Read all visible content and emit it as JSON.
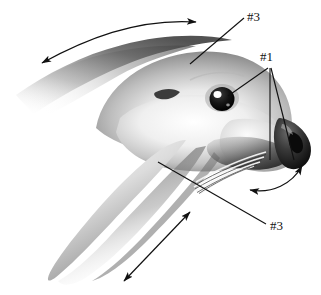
{
  "figure": {
    "background_color": "#ffffff",
    "ink_color": "#111111",
    "width": 321,
    "height": 295
  },
  "labels": [
    {
      "id": "top-3",
      "text": "#3",
      "x": 247,
      "y": 10,
      "points_to": "forehead-crown",
      "leader": "straight-line-down-left"
    },
    {
      "id": "measure-1",
      "text": "#1",
      "x": 260,
      "y": 50,
      "points_to": "eye-and-muzzle",
      "leader": "three-line-fan"
    },
    {
      "id": "bottom-3",
      "text": "#3",
      "x": 270,
      "y": 219,
      "points_to": "cheek-whisker-pad",
      "leader": "straight-line-up-left"
    }
  ],
  "arrows": [
    {
      "id": "crown-arc",
      "kind": "double-headed-curved",
      "location": "above-head-crown",
      "meaning": "dorsal-head-length-direction"
    },
    {
      "id": "throat-straight",
      "kind": "double-headed-straight",
      "location": "lower-right-of-throat",
      "meaning": "throat-depth-direction"
    },
    {
      "id": "muzzle-arc",
      "kind": "double-headed-curved",
      "location": "below-muzzle-nose",
      "meaning": "muzzle-circumference-direction"
    }
  ],
  "anatomy": [
    {
      "id": "eye",
      "name": "eye",
      "description": "dark round eye with white catchlight"
    },
    {
      "id": "ear-opening",
      "name": "ear-opening",
      "description": "small dark crescent above and left of eye"
    },
    {
      "id": "nose",
      "name": "nose",
      "description": "dark rounded nose pad with nostril at right"
    },
    {
      "id": "whiskers",
      "name": "whiskers",
      "description": "vibrissae radiating down-left from muzzle"
    },
    {
      "id": "throat",
      "name": "throat",
      "description": "shaded throat and chin extending to lower left"
    },
    {
      "id": "crown",
      "name": "crown",
      "description": "smoothly shaded top of head fading toward left"
    }
  ]
}
